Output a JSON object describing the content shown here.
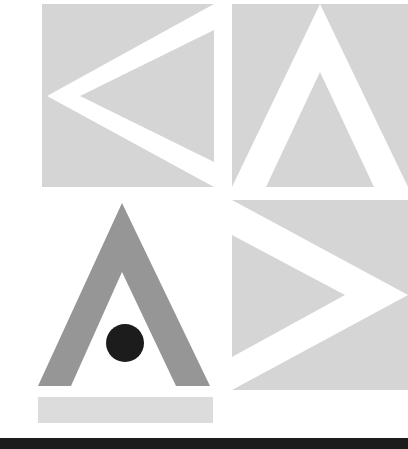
{
  "artwork": {
    "title": "Abstract Geometric Chevron Composition",
    "canvas": {
      "width": 408,
      "height": 449,
      "background_color": "#ffffff"
    },
    "palette": {
      "light_gray": "#d5d5d5",
      "pale_gray": "#dcdcdc",
      "medium_gray": "#969696",
      "near_black": "#1c1c1c",
      "white": "#ffffff"
    },
    "panels": [
      {
        "name": "top-left-panel",
        "shape": "square",
        "fill": "#d5d5d5",
        "x": 42,
        "y": 4,
        "width": 172,
        "height": 183,
        "motif": "white-chevron-pointing-left",
        "motif_fill": "#ffffff"
      },
      {
        "name": "top-right-panel",
        "shape": "square",
        "fill": "#d5d5d5",
        "x": 232,
        "y": 4,
        "width": 176,
        "height": 183,
        "motif": "white-chevron-pointing-up",
        "motif_fill": "#ffffff"
      },
      {
        "name": "bottom-left-panel",
        "shape": "open-triangle-outline",
        "fill": "#969696",
        "x": 38,
        "y": 203,
        "width": 172,
        "height": 183,
        "motif": "gray-chevron-pointing-up",
        "motif_fill": "#969696"
      },
      {
        "name": "bottom-right-panel",
        "shape": "square",
        "fill": "#d5d5d5",
        "x": 232,
        "y": 200,
        "width": 176,
        "height": 190,
        "motif": "white-chevron-pointing-right",
        "motif_fill": "#ffffff"
      }
    ],
    "accents": [
      {
        "name": "dark-circle-accent",
        "shape": "circle",
        "fill": "#1c1c1c",
        "cx": 125,
        "cy": 343,
        "r": 19
      },
      {
        "name": "gray-bar-accent",
        "shape": "rectangle",
        "fill": "#dcdcdc",
        "x": 38,
        "y": 397,
        "width": 175,
        "height": 26
      },
      {
        "name": "bottom-dark-bar",
        "shape": "rectangle",
        "fill": "#1c1c1c",
        "x": 0,
        "y": 438,
        "width": 408,
        "height": 11
      }
    ]
  }
}
